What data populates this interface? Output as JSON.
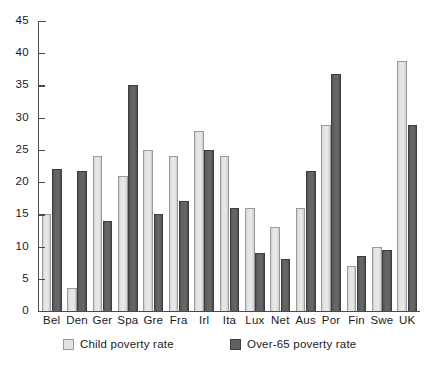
{
  "chart_data": {
    "type": "bar",
    "title": "",
    "subtitle": "",
    "xlabel": "",
    "ylabel": "",
    "ylim": [
      0,
      45
    ],
    "yticks": [
      0,
      5,
      10,
      15,
      20,
      25,
      30,
      35,
      40,
      45
    ],
    "grid": false,
    "legend_position": "bottom",
    "categories": [
      "Bel",
      "Den",
      "Ger",
      "Spa",
      "Gre",
      "Fra",
      "Irl",
      "Ita",
      "Lux",
      "Net",
      "Aus",
      "Por",
      "Fin",
      "Swe",
      "UK"
    ],
    "series": [
      {
        "name": "Child poverty rate",
        "color": "#e2e2e2",
        "values": [
          15,
          3.5,
          24,
          21,
          25,
          24,
          28,
          24,
          16,
          13,
          16,
          28.8,
          7,
          10,
          38.8
        ]
      },
      {
        "name": "Over-65 poverty rate",
        "color": "#616161",
        "values": [
          22,
          21.8,
          14,
          35,
          15,
          17,
          25,
          16,
          9,
          8,
          21.8,
          36.8,
          8.5,
          9.5,
          28.8
        ]
      }
    ]
  },
  "legend": {
    "items": [
      {
        "label": "Child poverty rate",
        "swatch": "child-swatch"
      },
      {
        "label": "Over-65 poverty rate",
        "swatch": "over65-swatch"
      }
    ]
  }
}
